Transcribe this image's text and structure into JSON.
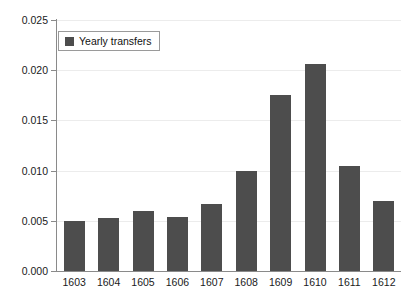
{
  "chart_data": {
    "type": "bar",
    "title": "",
    "subtitle": "",
    "xlabel": "",
    "ylabel": "",
    "categories": [
      "1603",
      "1604",
      "1605",
      "1606",
      "1607",
      "1608",
      "1609",
      "1610",
      "1611",
      "1612"
    ],
    "series": [
      {
        "name": "Yearly transfers",
        "values": [
          0.005,
          0.0053,
          0.006,
          0.0054,
          0.0067,
          0.01,
          0.0175,
          0.0206,
          0.0105,
          0.007
        ]
      }
    ],
    "ylim": [
      0.0,
      0.025
    ],
    "ytick_labels": [
      "0.000",
      "0.005",
      "0.010",
      "0.015",
      "0.020",
      "0.025"
    ],
    "ytick_values": [
      0.0,
      0.005,
      0.01,
      0.015,
      0.02,
      0.025
    ],
    "grid": true,
    "grid_axis": "y",
    "legend_position": "top-left",
    "bar_color": "#4d4d4d",
    "grid_color": "#ececec",
    "axis_color": "#8a8a8a"
  },
  "legend": {
    "entries": [
      {
        "label": "Yearly transfers",
        "color": "#4d4d4d"
      }
    ]
  }
}
